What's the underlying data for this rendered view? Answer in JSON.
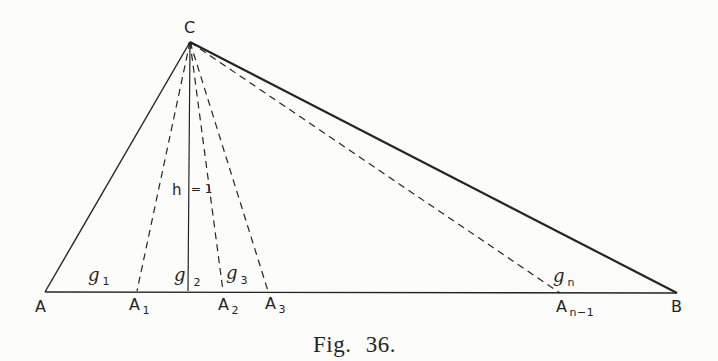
{
  "figure": {
    "caption": "Fig. 36.",
    "apex_label": "C",
    "altitude": {
      "symbol": "h",
      "value": "= 1"
    },
    "base_labels": [
      {
        "main": "A",
        "sub": ""
      },
      {
        "main": "A",
        "sub": "1"
      },
      {
        "main": "A",
        "sub": "2"
      },
      {
        "main": "A",
        "sub": "3"
      },
      {
        "main": "A",
        "sub": "n−1"
      },
      {
        "main": "B",
        "sub": ""
      }
    ],
    "region_labels": [
      {
        "main": "g",
        "sub": "1"
      },
      {
        "main": "g",
        "sub": "2"
      },
      {
        "main": "g",
        "sub": "3"
      },
      {
        "main": "g",
        "sub": "n"
      }
    ],
    "colors": {
      "ink": "#242424",
      "paper": "#fcfcfa"
    }
  }
}
